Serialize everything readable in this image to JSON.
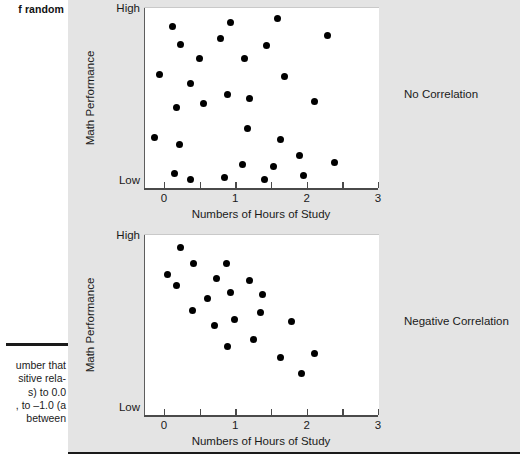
{
  "margin": {
    "top_text": "f random",
    "body_lines": [
      "umber that",
      "sitive rela-",
      "s) to 0.0",
      ", to –1.0 (a",
      "between"
    ]
  },
  "figure": {
    "panel_color": "#e4e4e4",
    "dot_color": "#000000",
    "axis_color": "#4a4a4a"
  },
  "chart_data": [
    {
      "type": "scatter",
      "title": "",
      "annotation": "No Correlation",
      "xlabel": "Numbers of Hours of Study",
      "ylabel": "Math Performance",
      "y_high_label": "High",
      "y_low_label": "Low",
      "xlim": [
        -0.28,
        3.0
      ],
      "ylim": [
        0,
        100
      ],
      "x_ticks": [
        0,
        0.5,
        1,
        1.5,
        2,
        2.5,
        3
      ],
      "x_tick_labels": [
        "0",
        "",
        "1",
        "",
        "2",
        "",
        "3"
      ],
      "grid": false,
      "legend": "none",
      "points": [
        {
          "x": 0.1,
          "y": 90
        },
        {
          "x": 0.22,
          "y": 80
        },
        {
          "x": 0.48,
          "y": 72
        },
        {
          "x": 0.92,
          "y": 92
        },
        {
          "x": 0.78,
          "y": 83
        },
        {
          "x": 1.58,
          "y": 94
        },
        {
          "x": 1.42,
          "y": 79
        },
        {
          "x": 2.28,
          "y": 85
        },
        {
          "x": -0.08,
          "y": 63
        },
        {
          "x": 0.36,
          "y": 58
        },
        {
          "x": 0.88,
          "y": 52
        },
        {
          "x": 1.18,
          "y": 50
        },
        {
          "x": 1.12,
          "y": 72
        },
        {
          "x": 1.68,
          "y": 62
        },
        {
          "x": 0.16,
          "y": 45
        },
        {
          "x": 0.54,
          "y": 47
        },
        {
          "x": 2.1,
          "y": 48
        },
        {
          "x": -0.14,
          "y": 28
        },
        {
          "x": 0.2,
          "y": 24
        },
        {
          "x": 1.15,
          "y": 33
        },
        {
          "x": 1.62,
          "y": 27
        },
        {
          "x": 1.88,
          "y": 18
        },
        {
          "x": 1.08,
          "y": 13
        },
        {
          "x": 1.52,
          "y": 12
        },
        {
          "x": 2.38,
          "y": 14
        },
        {
          "x": 0.14,
          "y": 8
        },
        {
          "x": 0.36,
          "y": 5
        },
        {
          "x": 0.84,
          "y": 6
        },
        {
          "x": 1.4,
          "y": 5
        },
        {
          "x": 1.94,
          "y": 7
        }
      ]
    },
    {
      "type": "scatter",
      "title": "",
      "annotation": "Negative Correlation",
      "xlabel": "Numbers of Hours of Study",
      "ylabel": "Math Performance",
      "y_high_label": "High",
      "y_low_label": "Low",
      "xlim": [
        -0.28,
        3.0
      ],
      "ylim": [
        0,
        100
      ],
      "x_ticks": [
        0,
        0.5,
        1,
        1.5,
        2,
        2.5,
        3
      ],
      "x_tick_labels": [
        "0",
        "",
        "1",
        "",
        "2",
        "",
        "3"
      ],
      "grid": false,
      "legend": "none",
      "points": [
        {
          "x": 0.22,
          "y": 93
        },
        {
          "x": 0.4,
          "y": 84
        },
        {
          "x": 0.86,
          "y": 84
        },
        {
          "x": 0.03,
          "y": 78
        },
        {
          "x": 0.72,
          "y": 76
        },
        {
          "x": 1.18,
          "y": 75
        },
        {
          "x": 0.16,
          "y": 72
        },
        {
          "x": 0.92,
          "y": 68
        },
        {
          "x": 1.36,
          "y": 67
        },
        {
          "x": 0.6,
          "y": 65
        },
        {
          "x": 0.38,
          "y": 58
        },
        {
          "x": 1.34,
          "y": 57
        },
        {
          "x": 0.98,
          "y": 53
        },
        {
          "x": 1.78,
          "y": 52
        },
        {
          "x": 0.7,
          "y": 50
        },
        {
          "x": 1.24,
          "y": 42
        },
        {
          "x": 0.88,
          "y": 38
        },
        {
          "x": 1.62,
          "y": 32
        },
        {
          "x": 2.1,
          "y": 34
        },
        {
          "x": 1.92,
          "y": 23
        }
      ]
    }
  ]
}
